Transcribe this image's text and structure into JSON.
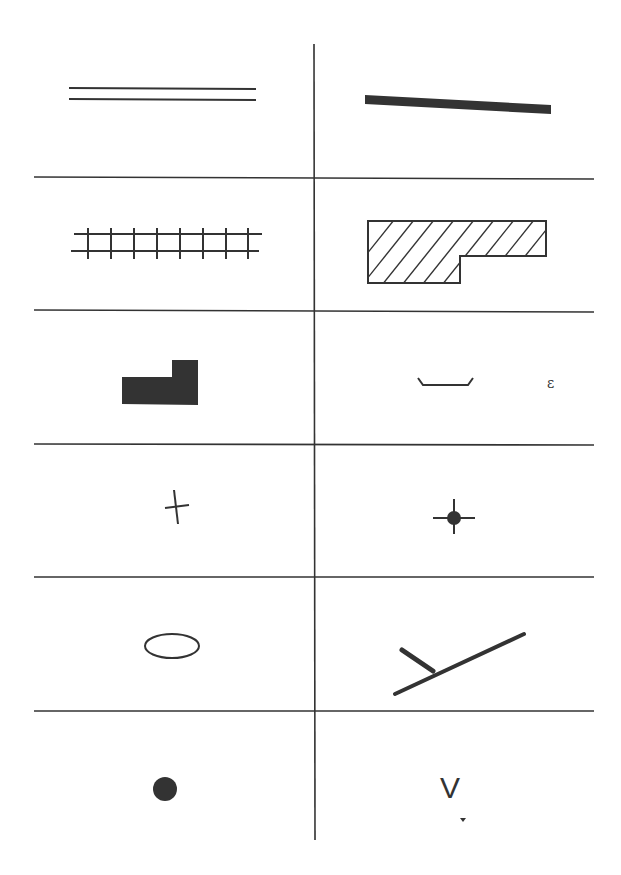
{
  "diagram": {
    "type": "symbol-legend-table",
    "columns": 2,
    "rows": 6,
    "line_color": "#333333",
    "fill_color": "#333333",
    "background": "#ffffff",
    "cells": [
      {
        "row": 1,
        "col": 1,
        "symbol": "double-parallel-line"
      },
      {
        "row": 1,
        "col": 2,
        "symbol": "thick-sloped-bar"
      },
      {
        "row": 2,
        "col": 1,
        "symbol": "railway-track-line"
      },
      {
        "row": 2,
        "col": 2,
        "symbol": "hatched-building-outline"
      },
      {
        "row": 3,
        "col": 1,
        "symbol": "solid-building-block"
      },
      {
        "row": 3,
        "col": 2,
        "symbol": "trough-bracket",
        "annotation": "ε"
      },
      {
        "row": 4,
        "col": 1,
        "symbol": "simple-cross"
      },
      {
        "row": 4,
        "col": 2,
        "symbol": "cross-with-dot"
      },
      {
        "row": 5,
        "col": 1,
        "symbol": "ellipse-outline"
      },
      {
        "row": 5,
        "col": 2,
        "symbol": "branching-line"
      },
      {
        "row": 6,
        "col": 1,
        "symbol": "solid-dot"
      },
      {
        "row": 6,
        "col": 2,
        "symbol": "v-mark",
        "label": "V",
        "sub_mark": "▾"
      }
    ]
  }
}
